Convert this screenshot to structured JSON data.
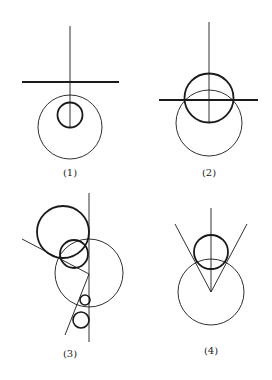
{
  "figures": [
    {
      "label": "(1)",
      "description": "Thin circle with smaller thick circle inside; horizontal thick line above; vertical line from top to small circle"
    },
    {
      "label": "(2)",
      "description": "Thick circle centered on horizontal thick line, overlapping thin circle below; vertical line through center"
    },
    {
      "label": "(3)",
      "description": "Vertical line tangent to several circles; two slanted lines from thin circle center; thick and small circles tangent"
    },
    {
      "label": "(4)",
      "description": "Thin circle with thick circle on top; two lines forming V from thin circle center tangent to thick circle; vertical line"
    }
  ],
  "colors": {
    "stroke": "#1a1a1a",
    "background": "#ffffff"
  }
}
